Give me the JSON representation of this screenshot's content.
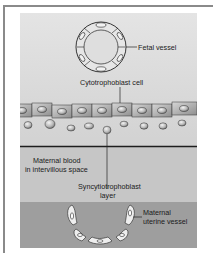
{
  "figure": {
    "labels": {
      "fetal_vessel": "Fetal vessel",
      "cytotrophoblast": "Cytotrophoblast cell",
      "maternal_blood_1": "Maternal blood",
      "maternal_blood_2": "in intervillous space",
      "syncytiotrophoblast_1": "Syncytiotrophoblast",
      "syncytiotrophoblast_2": "layer",
      "maternal_vessel_1": "Maternal",
      "maternal_vessel_2": "uterine vessel"
    },
    "colors": {
      "panel_light": "#dcdcdc",
      "panel_mid": "#c8c8c8",
      "panel_dark": "#9c9c9c",
      "cell_fill": "#b4b4b4",
      "line": "#222222"
    }
  }
}
